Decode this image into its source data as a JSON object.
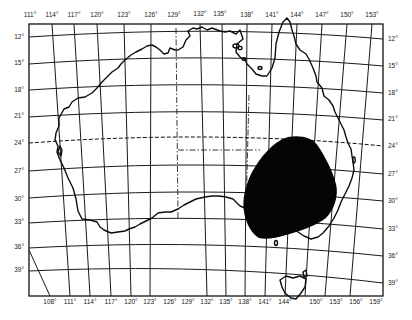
{
  "map": {
    "subject": "Australia",
    "projection_grid": "latitude/longitude graticule",
    "colors": {
      "background": "#ffffff",
      "lines": "#111111",
      "highlighted_region": "#050505"
    },
    "top_longitude_labels": [
      "111°",
      "114°",
      "117°",
      "120°",
      "123°",
      "126°",
      "129°",
      "132°",
      "135°",
      "138°",
      "141°",
      "144°",
      "147°",
      "150°",
      "153°"
    ],
    "bottom_longitude_labels": [
      "108°",
      "111°",
      "114°",
      "117°",
      "120°",
      "123°",
      "126°",
      "129°",
      "132°",
      "135°",
      "138°",
      "141°",
      "144°",
      "150°",
      "153°",
      "156°",
      "159°"
    ],
    "left_latitude_labels": [
      "12°",
      "15°",
      "18°",
      "21°",
      "24°",
      "27°",
      "30°",
      "33°",
      "36°",
      "39°"
    ],
    "right_latitude_labels": [
      "12°",
      "15°",
      "18°",
      "21°",
      "24°",
      "27°",
      "30°",
      "33°",
      "36°",
      "39°"
    ],
    "features": {
      "tropic_line": "dashed line near 23.5° S (Tropic of Capricorn)",
      "state_borders": "dash-dot lines",
      "highlighted_region": "solid black area over south-eastern interior (SW Queensland / NW New South Wales / NE South Australia)"
    }
  }
}
